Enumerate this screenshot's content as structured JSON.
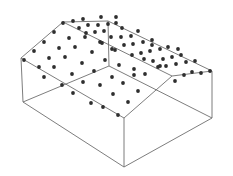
{
  "diagram": {
    "title": "",
    "colors": {
      "edge": "#6e6e6e",
      "point": "#2e2e2e",
      "background": "#ffffff"
    },
    "edges": [
      [
        21,
        58,
        63,
        22
      ],
      [
        63,
        22,
        108,
        21
      ],
      [
        108,
        21,
        212,
        71
      ],
      [
        21,
        58,
        124,
        118
      ],
      [
        124,
        118,
        172,
        76
      ],
      [
        172,
        76,
        212,
        71
      ],
      [
        63,
        22,
        172,
        76
      ],
      [
        108,
        21,
        109,
        66
      ],
      [
        23,
        102,
        109,
        66
      ],
      [
        109,
        66,
        212,
        118
      ],
      [
        21,
        58,
        23,
        102
      ],
      [
        23,
        102,
        124,
        167
      ],
      [
        124,
        118,
        124,
        167
      ],
      [
        124,
        167,
        212,
        118
      ],
      [
        212,
        71,
        212,
        118
      ]
    ],
    "points": [
      [
        24,
        60
      ],
      [
        34,
        51
      ],
      [
        44,
        42
      ],
      [
        54,
        32
      ],
      [
        63,
        23
      ],
      [
        39,
        67
      ],
      [
        49,
        58
      ],
      [
        59,
        48
      ],
      [
        69,
        38
      ],
      [
        44,
        77
      ],
      [
        54,
        67
      ],
      [
        65,
        57
      ],
      [
        75,
        47
      ],
      [
        85,
        37
      ],
      [
        62,
        85
      ],
      [
        72,
        74
      ],
      [
        82,
        63
      ],
      [
        92,
        52
      ],
      [
        73,
        93
      ],
      [
        94,
        71
      ],
      [
        105,
        60
      ],
      [
        102,
        43
      ],
      [
        91,
        103
      ],
      [
        103,
        107
      ],
      [
        118,
        115
      ],
      [
        83,
        82
      ],
      [
        100,
        85
      ],
      [
        113,
        94
      ],
      [
        128,
        102
      ],
      [
        112,
        77
      ],
      [
        123,
        83
      ],
      [
        138,
        91
      ],
      [
        73,
        21
      ],
      [
        83,
        19
      ],
      [
        101,
        17
      ],
      [
        116,
        23
      ],
      [
        79,
        28
      ],
      [
        88,
        25
      ],
      [
        98,
        25
      ],
      [
        108,
        24
      ],
      [
        86,
        33
      ],
      [
        95,
        32
      ],
      [
        104,
        31
      ],
      [
        100,
        42
      ],
      [
        111,
        37
      ],
      [
        121,
        37
      ],
      [
        131,
        36
      ],
      [
        115,
        50
      ],
      [
        124,
        45
      ],
      [
        133,
        44
      ],
      [
        143,
        42
      ],
      [
        152,
        40
      ],
      [
        112,
        49
      ],
      [
        132,
        55
      ],
      [
        141,
        53
      ],
      [
        150,
        51
      ],
      [
        160,
        49
      ],
      [
        168,
        47
      ],
      [
        119,
        65
      ],
      [
        134,
        69
      ],
      [
        144,
        59
      ],
      [
        153,
        61
      ],
      [
        163,
        59
      ],
      [
        172,
        57
      ],
      [
        181,
        55
      ],
      [
        145,
        74
      ],
      [
        158,
        67
      ],
      [
        166,
        66
      ],
      [
        176,
        64
      ],
      [
        186,
        62
      ],
      [
        195,
        61
      ],
      [
        134,
        75
      ],
      [
        175,
        81
      ],
      [
        184,
        75
      ],
      [
        192,
        72
      ],
      [
        201,
        73
      ],
      [
        210,
        71
      ],
      [
        160,
        66
      ],
      [
        178,
        49
      ],
      [
        138,
        31
      ],
      [
        122,
        28
      ],
      [
        116,
        17
      ],
      [
        152,
        45
      ]
    ]
  }
}
